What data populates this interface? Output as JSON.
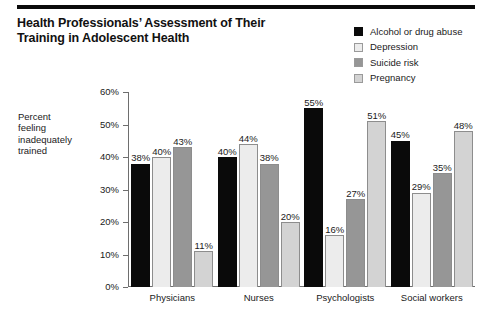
{
  "title": {
    "line1": "Health Professionals’ Assessment of Their",
    "line2": "Training in Adolescent Health"
  },
  "axis_caption": {
    "line1": "Percent",
    "line2": "feeling",
    "line3": "inadequately",
    "line4": "trained"
  },
  "legend": {
    "items": [
      {
        "label": "Alcohol or drug abuse",
        "color": "#0a0a0a"
      },
      {
        "label": "Depression",
        "color": "#ececec"
      },
      {
        "label": "Suicide risk",
        "color": "#969696"
      },
      {
        "label": "Pregnancy",
        "color": "#d3d3d3"
      }
    ]
  },
  "yaxis": {
    "ticks": [
      "60%",
      "50%",
      "40%",
      "30%",
      "20%",
      "10%",
      "0%"
    ]
  },
  "chart_data": {
    "type": "bar",
    "title": "Health Professionals’ Assessment of Their Training in Adolescent Health",
    "xlabel": "",
    "ylabel": "Percent feeling inadequately trained",
    "ylim": [
      0,
      60
    ],
    "ytick_step": 10,
    "grid": false,
    "legend_position": "top-right",
    "categories": [
      "Physicians",
      "Nurses",
      "Psychologists",
      "Social workers"
    ],
    "series": [
      {
        "name": "Alcohol or drug abuse",
        "color": "#0a0a0a",
        "values": [
          38,
          40,
          55,
          45
        ],
        "labels": [
          "38%",
          "40%",
          "55%",
          "45%"
        ]
      },
      {
        "name": "Depression",
        "color": "#ececec",
        "values": [
          40,
          44,
          16,
          29
        ],
        "labels": [
          "40%",
          "44%",
          "16%",
          "29%"
        ]
      },
      {
        "name": "Suicide risk",
        "color": "#969696",
        "values": [
          43,
          38,
          27,
          35
        ],
        "labels": [
          "43%",
          "38%",
          "27%",
          "35%"
        ]
      },
      {
        "name": "Pregnancy",
        "color": "#d3d3d3",
        "values": [
          11,
          20,
          51,
          48
        ],
        "labels": [
          "11%",
          "20%",
          "51%",
          "48%"
        ]
      }
    ]
  }
}
